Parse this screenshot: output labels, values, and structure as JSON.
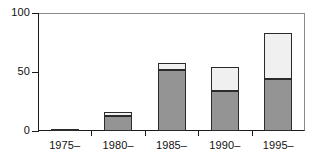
{
  "chart_data": {
    "type": "bar",
    "stacked": true,
    "title": "",
    "subtitle": "",
    "xlabel": "",
    "ylabel": "",
    "categories": [
      "1975–",
      "1980–",
      "1985–",
      "1990–",
      "1995–"
    ],
    "series": [
      {
        "name": "lower-segment",
        "color": "#949494",
        "values": [
          1,
          13,
          52,
          34,
          44
        ]
      },
      {
        "name": "upper-segment",
        "color": "#f0f0f0",
        "values": [
          0,
          3,
          6,
          20,
          39
        ]
      }
    ],
    "totals": [
      1,
      16,
      58,
      54,
      83
    ],
    "ylim": [
      0,
      100
    ],
    "yticks": [
      0,
      50,
      100
    ],
    "yticklabels": [
      "0",
      "50",
      "100"
    ],
    "xticklabels": [
      "1975–",
      "1980–",
      "1985–",
      "1990–",
      "1995–"
    ],
    "grid": false,
    "legend": "none",
    "frame": "box",
    "colors": {
      "lower": "#949494",
      "upper": "#f0f0f0",
      "axis": "#1a1a1a",
      "bar_border": "#2b2b2b",
      "background": "#ffffff"
    }
  },
  "axes": {
    "y": {
      "ticks": [
        {
          "label": "100",
          "value": 100
        },
        {
          "label": "50",
          "value": 50
        },
        {
          "label": "0",
          "value": 0
        }
      ]
    },
    "x": {
      "ticks": [
        {
          "label": "1975–"
        },
        {
          "label": "1980–"
        },
        {
          "label": "1985–"
        },
        {
          "label": "1990–"
        },
        {
          "label": "1995–"
        }
      ]
    }
  }
}
